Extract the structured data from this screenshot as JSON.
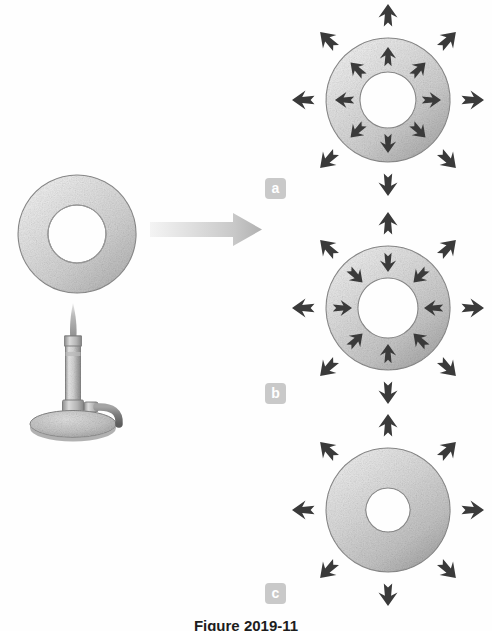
{
  "figure": {
    "caption": "Figure 2019-11",
    "domain_type": "diagram",
    "background_color": "#fefefe"
  },
  "palette": {
    "metal_light": "#e8e8e8",
    "metal_mid": "#c4c4c4",
    "metal_dark": "#9a9a9a",
    "metal_edge": "#8d8d8d",
    "arrow_dark": "#3a3a3a",
    "big_arrow_light": "#ececec",
    "big_arrow_dark": "#b6b6b6",
    "badge_bg": "#c9c9c9",
    "badge_text": "#ffffff",
    "caption_text": "#1d1d1d",
    "hole_fill": "#ffffff"
  },
  "source_object": {
    "name": "metal-ring-unheated",
    "label": "",
    "center_x": 77,
    "center_y": 234,
    "outer_radius": 59,
    "inner_radius": 29
  },
  "burner": {
    "name": "bunsen-burner",
    "label": "",
    "base_center_x": 73,
    "base_center_y": 424,
    "base_rx": 43,
    "base_ry": 13,
    "barrel_x": 66,
    "barrel_top": 337,
    "barrel_bottom": 414,
    "barrel_width": 14,
    "flame_tip_y": 303,
    "hose_end_x": 120,
    "hose_end_y": 412
  },
  "transition_arrow": {
    "name": "heating-transition-arrow",
    "direction": "right",
    "x_start": 148,
    "x_end": 262,
    "y": 229,
    "gradient_from": "#ececec",
    "gradient_to": "#b6b6b6"
  },
  "panels": [
    {
      "id": "a",
      "badge_label": "a",
      "center_x": 388,
      "center_y": 100,
      "outer_radius": 62,
      "inner_radius": 28,
      "outer_arrows": 8,
      "outer_arrow_direction": "outward",
      "inner_arrows": 8,
      "inner_arrow_direction": "outward",
      "description": "Ring expands outward and the hole also gets larger"
    },
    {
      "id": "b",
      "badge_label": "b",
      "center_x": 388,
      "center_y": 308,
      "outer_radius": 62,
      "inner_radius": 30,
      "outer_arrows": 8,
      "outer_arrow_direction": "outward",
      "inner_arrows": 8,
      "inner_arrow_direction": "inward",
      "description": "Ring expands outward while the hole shrinks"
    },
    {
      "id": "c",
      "badge_label": "c",
      "center_x": 388,
      "center_y": 510,
      "outer_radius": 62,
      "inner_radius": 22,
      "outer_arrows": 8,
      "outer_arrow_direction": "outward",
      "inner_arrows": 0,
      "inner_arrow_direction": "none",
      "description": "Ring expands outward and the hole stays the same size"
    }
  ]
}
